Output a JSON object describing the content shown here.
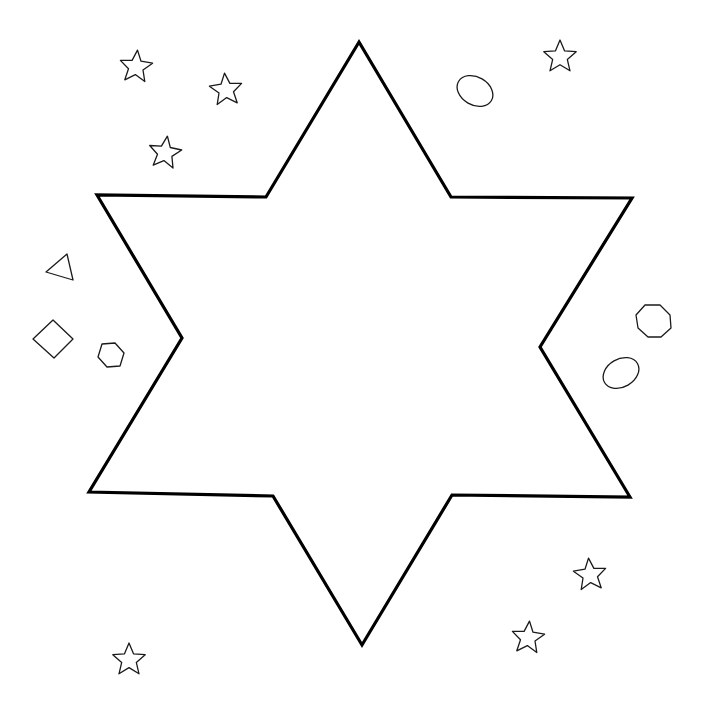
{
  "canvas": {
    "width": 712,
    "height": 717,
    "background": "#ffffff",
    "line_color": "#000000"
  },
  "big_star": {
    "name": "six-pointed-star",
    "points": "359,42 451,197 632,198 540,347 630,497 452,495 362,645 273,496 89,492 182,338 97,195 266,197"
  },
  "small_shapes": [
    {
      "type": "star",
      "name": "small-star-1",
      "cx": 136,
      "cy": 67,
      "r": 17,
      "rot": 5
    },
    {
      "type": "star",
      "name": "small-star-2",
      "cx": 226,
      "cy": 90,
      "r": 17,
      "rot": -5
    },
    {
      "type": "star",
      "name": "small-star-3",
      "cx": 165,
      "cy": 153,
      "r": 17,
      "rot": 8
    },
    {
      "type": "star",
      "name": "small-star-4",
      "cx": 560,
      "cy": 57,
      "r": 17,
      "rot": 0
    },
    {
      "type": "star",
      "name": "small-star-5",
      "cx": 590,
      "cy": 575,
      "r": 17,
      "rot": -5
    },
    {
      "type": "star",
      "name": "small-star-6",
      "cx": 528,
      "cy": 638,
      "r": 17,
      "rot": 5
    },
    {
      "type": "star",
      "name": "small-star-7",
      "cx": 129,
      "cy": 660,
      "r": 17,
      "rot": 0
    },
    {
      "type": "ellipse",
      "name": "oval-top",
      "cx": 475,
      "cy": 91,
      "rx": 19,
      "ry": 14,
      "rot": 30
    },
    {
      "type": "ellipse",
      "name": "oval-right",
      "cx": 621,
      "cy": 373,
      "rx": 19,
      "ry": 14,
      "rot": -30
    },
    {
      "type": "polygon",
      "name": "octagon",
      "points": "645,305 660,305 670,315 671,328 661,337 648,337 638,328 636,315"
    },
    {
      "type": "polygon",
      "name": "triangle",
      "points": "67,254 46,272 73,280"
    },
    {
      "type": "polygon",
      "name": "diamond",
      "points": "53,320 73,339 54,358 33,339"
    },
    {
      "type": "polygon",
      "name": "hexagon",
      "points": "102,344 115,343 124,353 120,366 107,367 98,357"
    }
  ]
}
